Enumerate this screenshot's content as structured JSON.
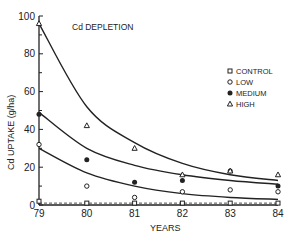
{
  "chart_data": {
    "type": "scatter",
    "title": "Cd DEPLETION",
    "xlabel": "YEARS",
    "ylabel": "Cd UPTAKE (g/ha)",
    "x": [
      79,
      80,
      81,
      82,
      83,
      84
    ],
    "xlim": [
      79,
      84
    ],
    "ylim": [
      0,
      100
    ],
    "yticks": [
      0,
      20,
      40,
      60,
      80,
      100
    ],
    "xticks": [
      "79",
      "80",
      "81",
      "82",
      "83",
      "84"
    ],
    "grid": false,
    "legend_position": "right",
    "series": [
      {
        "name": "CONTROL",
        "marker": "square-open",
        "values": [
          2,
          1,
          1,
          1,
          1,
          1
        ]
      },
      {
        "name": "LOW",
        "marker": "circle-open",
        "values": [
          32,
          10,
          4,
          7,
          8,
          7
        ]
      },
      {
        "name": "MEDIUM",
        "marker": "circle-filled",
        "values": [
          48,
          24,
          12,
          13,
          18,
          10
        ]
      },
      {
        "name": "HIGH",
        "marker": "triangle-open",
        "values": [
          96,
          42,
          30,
          16,
          18,
          16
        ]
      }
    ],
    "fitted_curves": [
      {
        "name": "HIGH fit",
        "values": [
          96,
          52,
          33,
          22,
          16,
          13
        ]
      },
      {
        "name": "MEDIUM fit",
        "values": [
          49,
          30,
          21,
          16,
          13,
          11
        ]
      },
      {
        "name": "LOW fit",
        "values": [
          30,
          17,
          10,
          6,
          4,
          3
        ]
      }
    ]
  },
  "legend": {
    "items": [
      {
        "label": "CONTROL"
      },
      {
        "label": "LOW"
      },
      {
        "label": "MEDIUM"
      },
      {
        "label": "HIGH"
      }
    ]
  },
  "colors": {
    "ink": "#222222",
    "background": "#ffffff"
  }
}
